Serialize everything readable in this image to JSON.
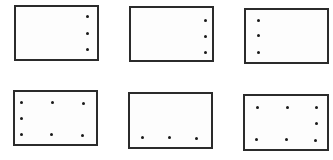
{
  "diagram": {
    "colors": {
      "border": "#2b2b2b",
      "dot": "#1a1a1a",
      "background": "#ffffff"
    },
    "boxes": [
      {
        "id": 1,
        "x": 14,
        "y": 5,
        "w": 85,
        "h": 56,
        "dots": [
          [
            87,
            16
          ],
          [
            87,
            33
          ],
          [
            87,
            49
          ]
        ]
      },
      {
        "id": 2,
        "x": 129,
        "y": 6,
        "w": 85,
        "h": 56,
        "dots": [
          [
            205,
            20
          ],
          [
            205,
            36
          ],
          [
            205,
            52
          ]
        ]
      },
      {
        "id": 3,
        "x": 244,
        "y": 8,
        "w": 85,
        "h": 56,
        "dots": [
          [
            258,
            20
          ],
          [
            258,
            35
          ],
          [
            258,
            52
          ]
        ]
      },
      {
        "id": 4,
        "x": 13,
        "y": 90,
        "w": 85,
        "h": 56,
        "dots": [
          [
            21,
            102
          ],
          [
            52,
            102
          ],
          [
            83,
            103
          ],
          [
            21,
            118
          ],
          [
            21,
            134
          ],
          [
            51,
            134
          ],
          [
            82,
            135
          ]
        ]
      },
      {
        "id": 5,
        "x": 128,
        "y": 92,
        "w": 85,
        "h": 57,
        "dots": [
          [
            142,
            137
          ],
          [
            169,
            137
          ],
          [
            196,
            138
          ]
        ]
      },
      {
        "id": 6,
        "x": 243,
        "y": 94,
        "w": 86,
        "h": 57,
        "dots": [
          [
            257,
            107
          ],
          [
            287,
            107
          ],
          [
            316,
            107
          ],
          [
            316,
            123
          ],
          [
            256,
            139
          ],
          [
            286,
            139
          ],
          [
            315,
            140
          ]
        ]
      }
    ]
  }
}
